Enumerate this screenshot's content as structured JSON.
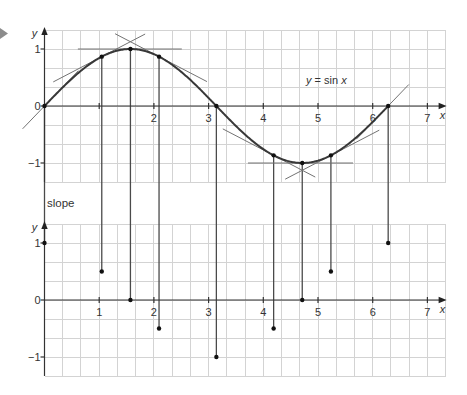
{
  "figure": {
    "marker_icon": "play-arrow",
    "colors": {
      "marker": "#8c8c8c",
      "grid": "#d3d3d3",
      "axis": "#333333",
      "curve": "#383838",
      "tangent": "#737373",
      "dot": "#111111"
    },
    "function_label": {
      "var_y": "y",
      "middle": " = sin ",
      "var_x": "x"
    }
  },
  "chart_data": [
    {
      "panel": "upper",
      "type": "line",
      "title": "y = sin x",
      "xlabel": "x",
      "ylabel": "y",
      "xlim": [
        0,
        7.33
      ],
      "ylim": [
        -1.33,
        1.33
      ],
      "grid": true,
      "x_ticks": [
        1,
        2,
        3,
        4,
        5,
        6,
        7
      ],
      "x_tick_labels": [
        "",
        "2",
        "3",
        "4",
        "5",
        "6",
        "7"
      ],
      "y_ticks": [
        1,
        0,
        -1
      ],
      "y_tick_labels": [
        "1",
        "0",
        "−1"
      ],
      "series": [
        {
          "name": "y = sin x",
          "function": "sin",
          "x_range": [
            0,
            6.2832
          ]
        },
        {
          "name": "marked points",
          "x": [
            0,
            1.047,
            1.571,
            2.094,
            3.142,
            4.189,
            4.712,
            5.236,
            6.283
          ],
          "y": [
            0,
            0.866,
            1,
            0.866,
            0,
            -0.866,
            -1,
            -0.866,
            0
          ]
        }
      ],
      "tangents": [
        {
          "at_x": 0,
          "at_y": 0,
          "slope": 1,
          "x_from": -0.4,
          "x_to": 0.62
        },
        {
          "at_x": 1.047,
          "at_y": 0.866,
          "slope": 0.5,
          "x_from": 0.16,
          "x_to": 1.84
        },
        {
          "at_x": 1.571,
          "at_y": 1,
          "slope": 0,
          "x_from": 0.61,
          "x_to": 2.51
        },
        {
          "at_x": 2.094,
          "at_y": 0.866,
          "slope": -0.5,
          "x_from": 1.29,
          "x_to": 2.97
        },
        {
          "at_x": 3.142,
          "at_y": 0,
          "slope": -1,
          "x_from": 2.88,
          "x_to": 3.4
        },
        {
          "at_x": 4.189,
          "at_y": -0.866,
          "slope": -0.5,
          "x_from": 3.26,
          "x_to": 4.95
        },
        {
          "at_x": 4.712,
          "at_y": -1,
          "slope": 0,
          "x_from": 3.72,
          "x_to": 5.64
        },
        {
          "at_x": 5.236,
          "at_y": -0.866,
          "slope": 0.5,
          "x_from": 4.4,
          "x_to": 6.12
        },
        {
          "at_x": 6.283,
          "at_y": 0,
          "slope": 1,
          "x_from": 5.7,
          "x_to": 6.66
        }
      ]
    },
    {
      "panel": "lower",
      "type": "scatter",
      "title": "slope",
      "xlabel": "x",
      "ylabel": "y",
      "xlim": [
        0,
        7.33
      ],
      "ylim": [
        -1.33,
        1.33
      ],
      "grid": true,
      "x_ticks": [
        1,
        2,
        3,
        4,
        5,
        6,
        7
      ],
      "x_tick_labels": [
        "1",
        "2",
        "3",
        "4",
        "5",
        "6",
        "7"
      ],
      "y_ticks": [
        1,
        0,
        -1
      ],
      "y_tick_labels": [
        "1",
        "0",
        "−1"
      ],
      "series": [
        {
          "name": "slope",
          "x": [
            0,
            1.047,
            1.571,
            2.094,
            3.142,
            4.189,
            4.712,
            5.236,
            6.283
          ],
          "y": [
            1,
            0.5,
            0,
            -0.5,
            -1,
            -0.5,
            0,
            0.5,
            1
          ]
        }
      ]
    }
  ]
}
